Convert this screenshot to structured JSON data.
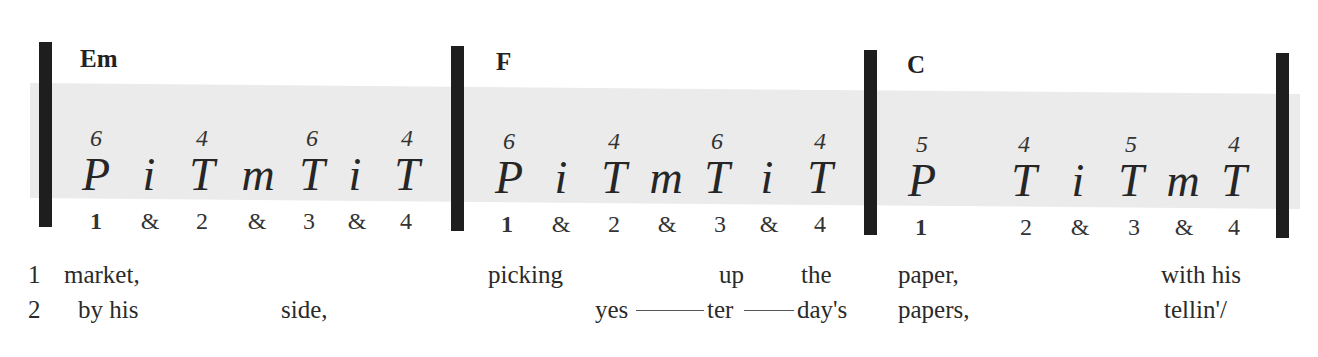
{
  "measures": [
    {
      "chord": "Em",
      "strokes": [
        {
          "finger": "P",
          "string": "6",
          "x": 96
        },
        {
          "finger": "i",
          "string": "",
          "x": 149
        },
        {
          "finger": "T",
          "string": "4",
          "x": 202
        },
        {
          "finger": "m",
          "string": "",
          "x": 258
        },
        {
          "finger": "T",
          "string": "6",
          "x": 312
        },
        {
          "finger": "i",
          "string": "",
          "x": 355
        },
        {
          "finger": "T",
          "string": "4",
          "x": 407
        }
      ],
      "counts": [
        {
          "label": "1",
          "x": 96,
          "strong": true
        },
        {
          "label": "&",
          "x": 150
        },
        {
          "label": "2",
          "x": 202
        },
        {
          "label": "&",
          "x": 257
        },
        {
          "label": "3",
          "x": 309
        },
        {
          "label": "&",
          "x": 357
        },
        {
          "label": "4",
          "x": 406
        }
      ]
    },
    {
      "chord": "F",
      "strokes": [
        {
          "finger": "P",
          "string": "6",
          "x": 509
        },
        {
          "finger": "i",
          "string": "",
          "x": 561
        },
        {
          "finger": "T",
          "string": "4",
          "x": 614
        },
        {
          "finger": "m",
          "string": "",
          "x": 666
        },
        {
          "finger": "T",
          "string": "6",
          "x": 717
        },
        {
          "finger": "i",
          "string": "",
          "x": 767
        },
        {
          "finger": "T",
          "string": "4",
          "x": 820
        }
      ],
      "counts": [
        {
          "label": "1",
          "x": 507,
          "strong": true
        },
        {
          "label": "&",
          "x": 561
        },
        {
          "label": "2",
          "x": 614
        },
        {
          "label": "&",
          "x": 667
        },
        {
          "label": "3",
          "x": 720
        },
        {
          "label": "&",
          "x": 769
        },
        {
          "label": "4",
          "x": 820
        }
      ]
    },
    {
      "chord": "C",
      "strokes": [
        {
          "finger": "P",
          "string": "5",
          "x": 922
        },
        {
          "finger": "T",
          "string": "4",
          "x": 1024
        },
        {
          "finger": "i",
          "string": "",
          "x": 1078
        },
        {
          "finger": "T",
          "string": "5",
          "x": 1131
        },
        {
          "finger": "m",
          "string": "",
          "x": 1183
        },
        {
          "finger": "T",
          "string": "4",
          "x": 1234
        }
      ],
      "counts": [
        {
          "label": "1",
          "x": 921,
          "strong": true
        },
        {
          "label": "2",
          "x": 1026
        },
        {
          "label": "&",
          "x": 1080
        },
        {
          "label": "3",
          "x": 1134
        },
        {
          "label": "&",
          "x": 1184
        },
        {
          "label": "4",
          "x": 1234
        }
      ]
    }
  ],
  "lyrics": {
    "verse1": {
      "number": "1",
      "words": [
        {
          "text": "market,",
          "x": 64
        },
        {
          "text": "picking",
          "x": 488
        },
        {
          "text": "up",
          "x": 719
        },
        {
          "text": "the",
          "x": 801
        },
        {
          "text": "paper,",
          "x": 898
        },
        {
          "text": "with his",
          "x": 1161
        }
      ]
    },
    "verse2": {
      "number": "2",
      "words": [
        {
          "text": "by his",
          "x": 78
        },
        {
          "text": "side,",
          "x": 281
        },
        {
          "text": "yes",
          "x": 595
        },
        {
          "text": "ter",
          "x": 707
        },
        {
          "text": "day's",
          "x": 797
        },
        {
          "text": "papers,",
          "x": 898
        },
        {
          "text": "tellin'/",
          "x": 1164
        }
      ]
    }
  }
}
